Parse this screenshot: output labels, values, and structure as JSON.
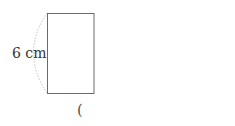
{
  "figure": {
    "shape": "rectangle",
    "side_label": "6 cm",
    "answer_paren": "(",
    "colors": {
      "stroke": "#6b6b6b",
      "arc": "#c8c8c8",
      "text": "#333333"
    }
  }
}
